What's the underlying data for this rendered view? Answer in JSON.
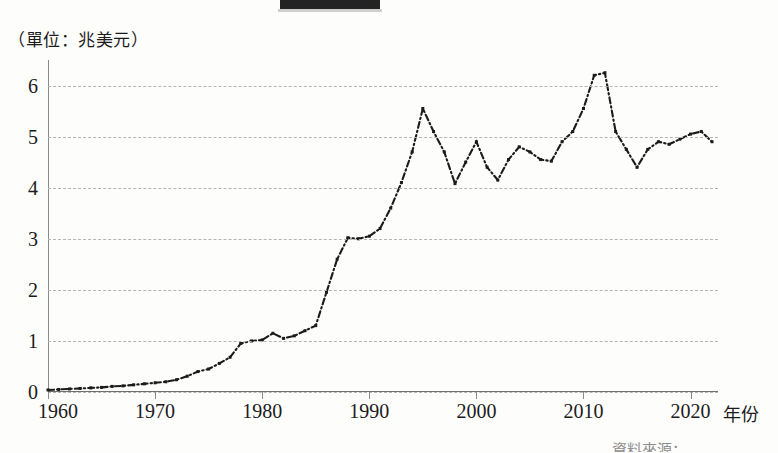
{
  "figure": {
    "unit_label": "（單位：兆美元）",
    "xaxis_title": "年份",
    "source_note": "資料來源：",
    "top_bar_name": "cropped-header-bar"
  },
  "chart_data": {
    "type": "line",
    "title": "",
    "subtitle": "",
    "unit": "兆美元",
    "xlabel": "年份",
    "ylabel": "",
    "xlim": [
      1960,
      2022
    ],
    "ylim": [
      0,
      6.5
    ],
    "ytick_labels": [
      "0",
      "1",
      "2",
      "3",
      "4",
      "5",
      "6"
    ],
    "ytick_values": [
      0,
      1,
      2,
      3,
      4,
      5,
      6
    ],
    "xtick_labels": [
      "1960",
      "1970",
      "1980",
      "1990",
      "2000",
      "2010",
      "2020"
    ],
    "xtick_values": [
      1960,
      1970,
      1980,
      1990,
      2000,
      2010,
      2020
    ],
    "grid": "horizontal-dashed",
    "legend": "none",
    "line_style": "dash-dot",
    "marker": "square-dot",
    "color": "#1b1b1b",
    "x": [
      1960,
      1961,
      1962,
      1963,
      1964,
      1965,
      1966,
      1967,
      1968,
      1969,
      1970,
      1971,
      1972,
      1973,
      1974,
      1975,
      1976,
      1977,
      1978,
      1979,
      1980,
      1981,
      1982,
      1983,
      1984,
      1985,
      1986,
      1987,
      1988,
      1989,
      1990,
      1991,
      1992,
      1993,
      1994,
      1995,
      1996,
      1997,
      1998,
      1999,
      2000,
      2001,
      2002,
      2003,
      2004,
      2005,
      2006,
      2007,
      2008,
      2009,
      2010,
      2011,
      2012,
      2013,
      2014,
      2015,
      2016,
      2017,
      2018,
      2019,
      2020,
      2021,
      2022
    ],
    "values": [
      0.04,
      0.05,
      0.06,
      0.07,
      0.08,
      0.09,
      0.11,
      0.12,
      0.14,
      0.16,
      0.18,
      0.2,
      0.24,
      0.31,
      0.4,
      0.45,
      0.56,
      0.68,
      0.95,
      1.0,
      1.02,
      1.15,
      1.05,
      1.1,
      1.2,
      1.3,
      1.95,
      2.6,
      3.02,
      3.0,
      3.05,
      3.2,
      3.6,
      4.1,
      4.7,
      5.55,
      5.1,
      4.7,
      4.08,
      4.5,
      4.9,
      4.4,
      4.15,
      4.55,
      4.8,
      4.7,
      4.55,
      4.52,
      4.9,
      5.1,
      5.55,
      6.2,
      6.25,
      5.1,
      4.75,
      4.4,
      4.75,
      4.9,
      4.85,
      4.95,
      5.05,
      5.1,
      4.9
    ],
    "annotations": [
      {
        "label": "peak",
        "x": 1995,
        "y": 5.55
      },
      {
        "label": "peak",
        "x": 2012,
        "y": 6.25
      },
      {
        "label": "trough",
        "x": 1998,
        "y": 4.08
      },
      {
        "label": "trough",
        "x": 2015,
        "y": 4.4
      }
    ]
  }
}
